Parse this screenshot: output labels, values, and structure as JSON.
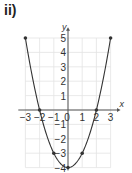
{
  "part_label": "ii)",
  "chart_data": {
    "type": "line",
    "title": "",
    "xlabel": "x",
    "ylabel": "y",
    "xlim": [
      -3,
      3
    ],
    "ylim": [
      -4,
      5
    ],
    "grid": true,
    "x_ticks": [
      "−3",
      "−2",
      "−1",
      "0",
      "1",
      "2",
      "3"
    ],
    "y_ticks": [
      "5",
      "4",
      "3",
      "2",
      "1",
      "−1",
      "−2",
      "−3",
      "−4"
    ],
    "series": [
      {
        "name": "y = x² − 4",
        "x": [
          -3,
          -2,
          -1,
          0,
          1,
          2,
          3
        ],
        "y": [
          5,
          0,
          -3,
          -4,
          -3,
          0,
          5
        ],
        "markers": true
      }
    ],
    "colors": {
      "curve": "#333333",
      "axis": "#555555",
      "grid": "#e3e3e3"
    }
  }
}
